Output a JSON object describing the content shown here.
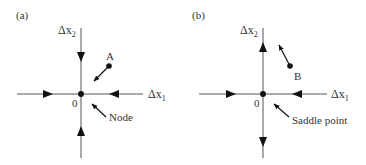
{
  "panels": [
    {
      "id": "a",
      "label": "(a)",
      "x_axis_label": "Δx",
      "x_axis_sub": "1",
      "y_axis_label": "Δx",
      "y_axis_sub": "2",
      "origin_label": "0",
      "point_label": "A",
      "annotation": "Node",
      "behavior": "all trajectories converge to origin"
    },
    {
      "id": "b",
      "label": "(b)",
      "x_axis_label": "Δx",
      "x_axis_sub": "1",
      "y_axis_label": "Δx",
      "y_axis_sub": "2",
      "origin_label": "0",
      "point_label": "B",
      "annotation": "Saddle point",
      "behavior": "converge along x1, diverge along x2"
    }
  ],
  "colors": {
    "line": "#555555",
    "ink": "#111111",
    "text": "#333333"
  }
}
